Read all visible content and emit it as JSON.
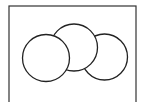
{
  "diagram": {
    "type": "overlapping-circles",
    "frame": {
      "x": 9,
      "y": 6,
      "width": 127,
      "height": 110,
      "stroke": "#333333"
    },
    "circles": [
      {
        "id": "right",
        "cx": 104.5,
        "cy": 57,
        "r": 23,
        "fill": "#ffffff",
        "stroke": "#222222"
      },
      {
        "id": "middle",
        "cx": 74,
        "cy": 47.5,
        "r": 23.5,
        "fill": "#ffffff",
        "stroke": "#222222"
      },
      {
        "id": "left",
        "cx": 46,
        "cy": 58,
        "r": 23.5,
        "fill": "#ffffff",
        "stroke": "#222222"
      }
    ]
  }
}
